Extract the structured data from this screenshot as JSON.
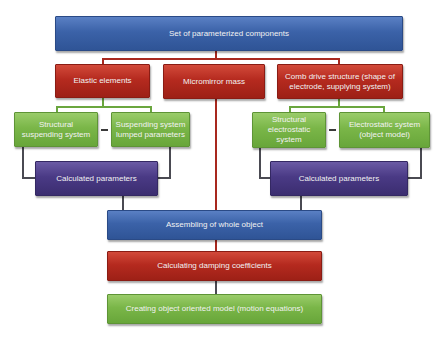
{
  "diagram": {
    "top": {
      "label": "Set of parameterized components"
    },
    "level2": [
      {
        "label": "Elastic elements"
      },
      {
        "label": "Micromirror mass"
      },
      {
        "label": "Comb drive structure (shape of electrode, supplying system)"
      }
    ],
    "left_group": {
      "items": [
        {
          "label": "Structural suspending system"
        },
        {
          "label": "Suspending system lumped parameters"
        }
      ],
      "result": {
        "label": "Calculated parameters"
      }
    },
    "right_group": {
      "items": [
        {
          "label": "Structural electrostatic system"
        },
        {
          "label": "Electrostatic system (object model)"
        }
      ],
      "result": {
        "label": "Calculated parameters"
      }
    },
    "assembly": {
      "label": "Assembling of whole object"
    },
    "damping": {
      "label": "Calculating damping coefficients"
    },
    "final": {
      "label": "Creating object oriented model (motion equations)"
    },
    "colors": {
      "blue": "#3b62a8",
      "red": "#b52a1f",
      "green": "#7ab648",
      "purple": "#4a3a85"
    }
  }
}
